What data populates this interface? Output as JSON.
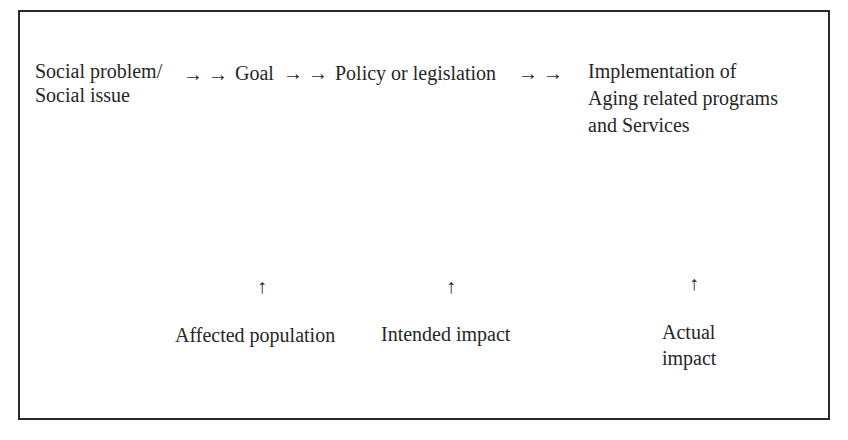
{
  "diagram": {
    "flow": {
      "step1": {
        "line1": "Social problem/",
        "line2": "Social issue"
      },
      "arrow1": "→ →",
      "step2": "Goal",
      "arrow2": "→ →",
      "step3": "Policy or legislation",
      "arrow3": "→ →",
      "step4": {
        "line1": "Implementation of",
        "line2": "Aging related programs",
        "line3": "and Services"
      }
    },
    "annotations": [
      {
        "arrow": "↑",
        "label": "Affected population"
      },
      {
        "arrow": "↑",
        "label": "Intended impact"
      },
      {
        "arrow": "↑",
        "label_line1": "Actual",
        "label_line2": "impact"
      }
    ]
  }
}
